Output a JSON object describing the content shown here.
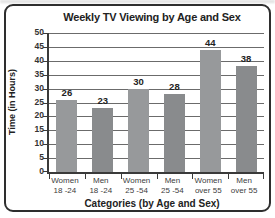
{
  "chart_data": {
    "type": "bar",
    "title": "Weekly TV Viewing by Age and Sex",
    "xlabel": "Categories (by Age and Sex)",
    "ylabel": "Time (in Hours)",
    "categories": [
      {
        "line1": "Women",
        "line2": "18 -24"
      },
      {
        "line1": "Men",
        "line2": "18 -24"
      },
      {
        "line1": "Women",
        "line2": "25 -54"
      },
      {
        "line1": "Men",
        "line2": "25 -54"
      },
      {
        "line1": "Women",
        "line2": "over 55"
      },
      {
        "line1": "Men",
        "line2": "over 55"
      }
    ],
    "values": [
      26,
      23,
      30,
      28,
      44,
      38
    ],
    "ylim": [
      0,
      50
    ],
    "ytick_step": 5,
    "grid": "horizontal",
    "legend": "none",
    "colors": {
      "bar_women": "#97999b",
      "bar_men": "#898b8d",
      "grid": "#6b6b6b",
      "axis": "#3a3a3a",
      "frame": "#2e2e2e",
      "text": "#222222"
    }
  }
}
